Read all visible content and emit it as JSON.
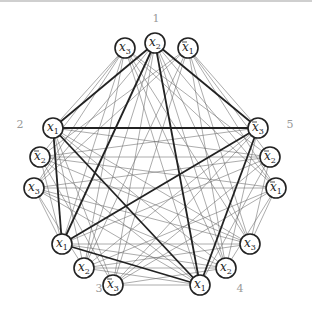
{
  "diagram": {
    "type": "clause-graph (3-SAT to clique reduction)",
    "groups": [
      {
        "label": "1",
        "label_pos": [
          156,
          22
        ],
        "nodes": [
          {
            "id": "g1a",
            "var": "x",
            "sub": "3",
            "neg": false,
            "x": 125,
            "y": 48
          },
          {
            "id": "g1b",
            "var": "x",
            "sub": "2",
            "neg": false,
            "x": 155,
            "y": 43
          },
          {
            "id": "g1c",
            "var": "x",
            "sub": "1",
            "neg": true,
            "x": 188,
            "y": 48
          }
        ]
      },
      {
        "label": "2",
        "label_pos": [
          20,
          128
        ],
        "nodes": [
          {
            "id": "g2a",
            "var": "x",
            "sub": "1",
            "neg": false,
            "x": 53,
            "y": 128
          },
          {
            "id": "g2b",
            "var": "x",
            "sub": "2",
            "neg": true,
            "x": 40,
            "y": 157
          },
          {
            "id": "g2c",
            "var": "x",
            "sub": "3",
            "neg": false,
            "x": 34,
            "y": 188
          }
        ]
      },
      {
        "label": "3",
        "label_pos": [
          99,
          292
        ],
        "nodes": [
          {
            "id": "g3a",
            "var": "x",
            "sub": "1",
            "neg": false,
            "x": 62,
            "y": 244
          },
          {
            "id": "g3b",
            "var": "x",
            "sub": "2",
            "neg": false,
            "x": 84,
            "y": 268
          },
          {
            "id": "g3c",
            "var": "x",
            "sub": "3",
            "neg": true,
            "x": 113,
            "y": 285
          }
        ]
      },
      {
        "label": "4",
        "label_pos": [
          240,
          292
        ],
        "nodes": [
          {
            "id": "g4a",
            "var": "x",
            "sub": "1",
            "neg": false,
            "x": 200,
            "y": 285
          },
          {
            "id": "g4b",
            "var": "x",
            "sub": "2",
            "neg": false,
            "x": 226,
            "y": 268
          },
          {
            "id": "g4c",
            "var": "x",
            "sub": "3",
            "neg": false,
            "x": 250,
            "y": 244
          }
        ]
      },
      {
        "label": "5",
        "label_pos": [
          290,
          128
        ],
        "nodes": [
          {
            "id": "g5a",
            "var": "x",
            "sub": "3",
            "neg": true,
            "x": 258,
            "y": 128
          },
          {
            "id": "g5b",
            "var": "x",
            "sub": "2",
            "neg": true,
            "x": 270,
            "y": 157
          },
          {
            "id": "g5c",
            "var": "x",
            "sub": "1",
            "neg": true,
            "x": 276,
            "y": 188
          }
        ]
      }
    ],
    "highlighted_clique": [
      "g1b",
      "g2a",
      "g3a",
      "g4a",
      "g5a"
    ],
    "edge_rule": "thin edges join nodes of different groups unless they are complementary literals; thick edges form the highlighted clique"
  }
}
